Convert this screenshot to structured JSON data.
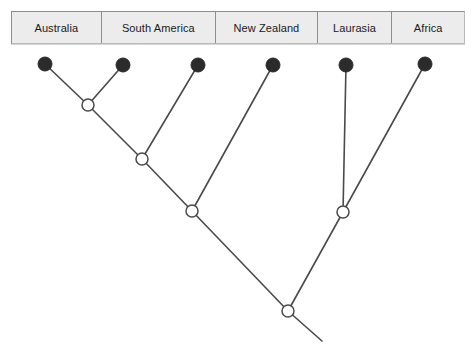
{
  "diagram": {
    "type": "cladogram",
    "title": "",
    "colors": {
      "background": "#ffffff",
      "branch": "#4a4a4a",
      "tip_node_fill": "#2b2b2b",
      "internal_node_fill": "#ffffff",
      "header_fill": "#ececec",
      "header_border": "#8d8d8d",
      "label_text": "#1a1a1a"
    }
  },
  "header": {
    "taxa": [
      {
        "label": "Australia",
        "x": 11,
        "width": 90
      },
      {
        "label": "South America",
        "x": 101,
        "width": 115
      },
      {
        "label": "New Zealand",
        "x": 216,
        "width": 102
      },
      {
        "label": "Laurasia",
        "x": 318,
        "width": 75
      },
      {
        "label": "Africa",
        "x": 393,
        "width": 72
      }
    ]
  },
  "tree": {
    "tips": [
      {
        "name": "Australia",
        "x": 45,
        "y": 64,
        "r": 7
      },
      {
        "name": "South America",
        "x": 123,
        "y": 65,
        "r": 7
      },
      {
        "name": "New Zealand-left",
        "x": 198,
        "y": 65,
        "r": 7
      },
      {
        "name": "New Zealand",
        "x": 273,
        "y": 65,
        "r": 7
      },
      {
        "name": "Laurasia",
        "x": 346,
        "y": 65,
        "r": 7
      },
      {
        "name": "Africa",
        "x": 425,
        "y": 64,
        "r": 7
      }
    ],
    "internal_nodes": [
      {
        "name": "node-australia-southamerica",
        "x": 88,
        "y": 105,
        "r": 6
      },
      {
        "name": "node-gondwana-west",
        "x": 142,
        "y": 159,
        "r": 6
      },
      {
        "name": "node-gondwana",
        "x": 192,
        "y": 211,
        "r": 6
      },
      {
        "name": "node-laurasia-africa",
        "x": 343,
        "y": 212,
        "r": 6
      },
      {
        "name": "node-root",
        "x": 288,
        "y": 311,
        "r": 6
      }
    ],
    "branches": [
      {
        "name": "branch-australia",
        "x1": 45,
        "y1": 64,
        "x2": 88,
        "y2": 105
      },
      {
        "name": "branch-southamerica",
        "x1": 123,
        "y1": 65,
        "x2": 88,
        "y2": 105
      },
      {
        "name": "branch-node1-node2",
        "x1": 88,
        "y1": 105,
        "x2": 142,
        "y2": 159
      },
      {
        "name": "branch-tip3-node2",
        "x1": 198,
        "y1": 65,
        "x2": 142,
        "y2": 159
      },
      {
        "name": "branch-node2-node3",
        "x1": 142,
        "y1": 159,
        "x2": 192,
        "y2": 211
      },
      {
        "name": "branch-newzealand",
        "x1": 273,
        "y1": 65,
        "x2": 192,
        "y2": 211
      },
      {
        "name": "branch-node3-root",
        "x1": 192,
        "y1": 211,
        "x2": 288,
        "y2": 311
      },
      {
        "name": "branch-laurasia",
        "x1": 346,
        "y1": 65,
        "x2": 343,
        "y2": 212
      },
      {
        "name": "branch-africa",
        "x1": 425,
        "y1": 64,
        "x2": 343,
        "y2": 212
      },
      {
        "name": "branch-node4-root",
        "x1": 343,
        "y1": 212,
        "x2": 288,
        "y2": 311
      },
      {
        "name": "branch-root-stem",
        "x1": 288,
        "y1": 311,
        "x2": 322,
        "y2": 341
      }
    ]
  }
}
